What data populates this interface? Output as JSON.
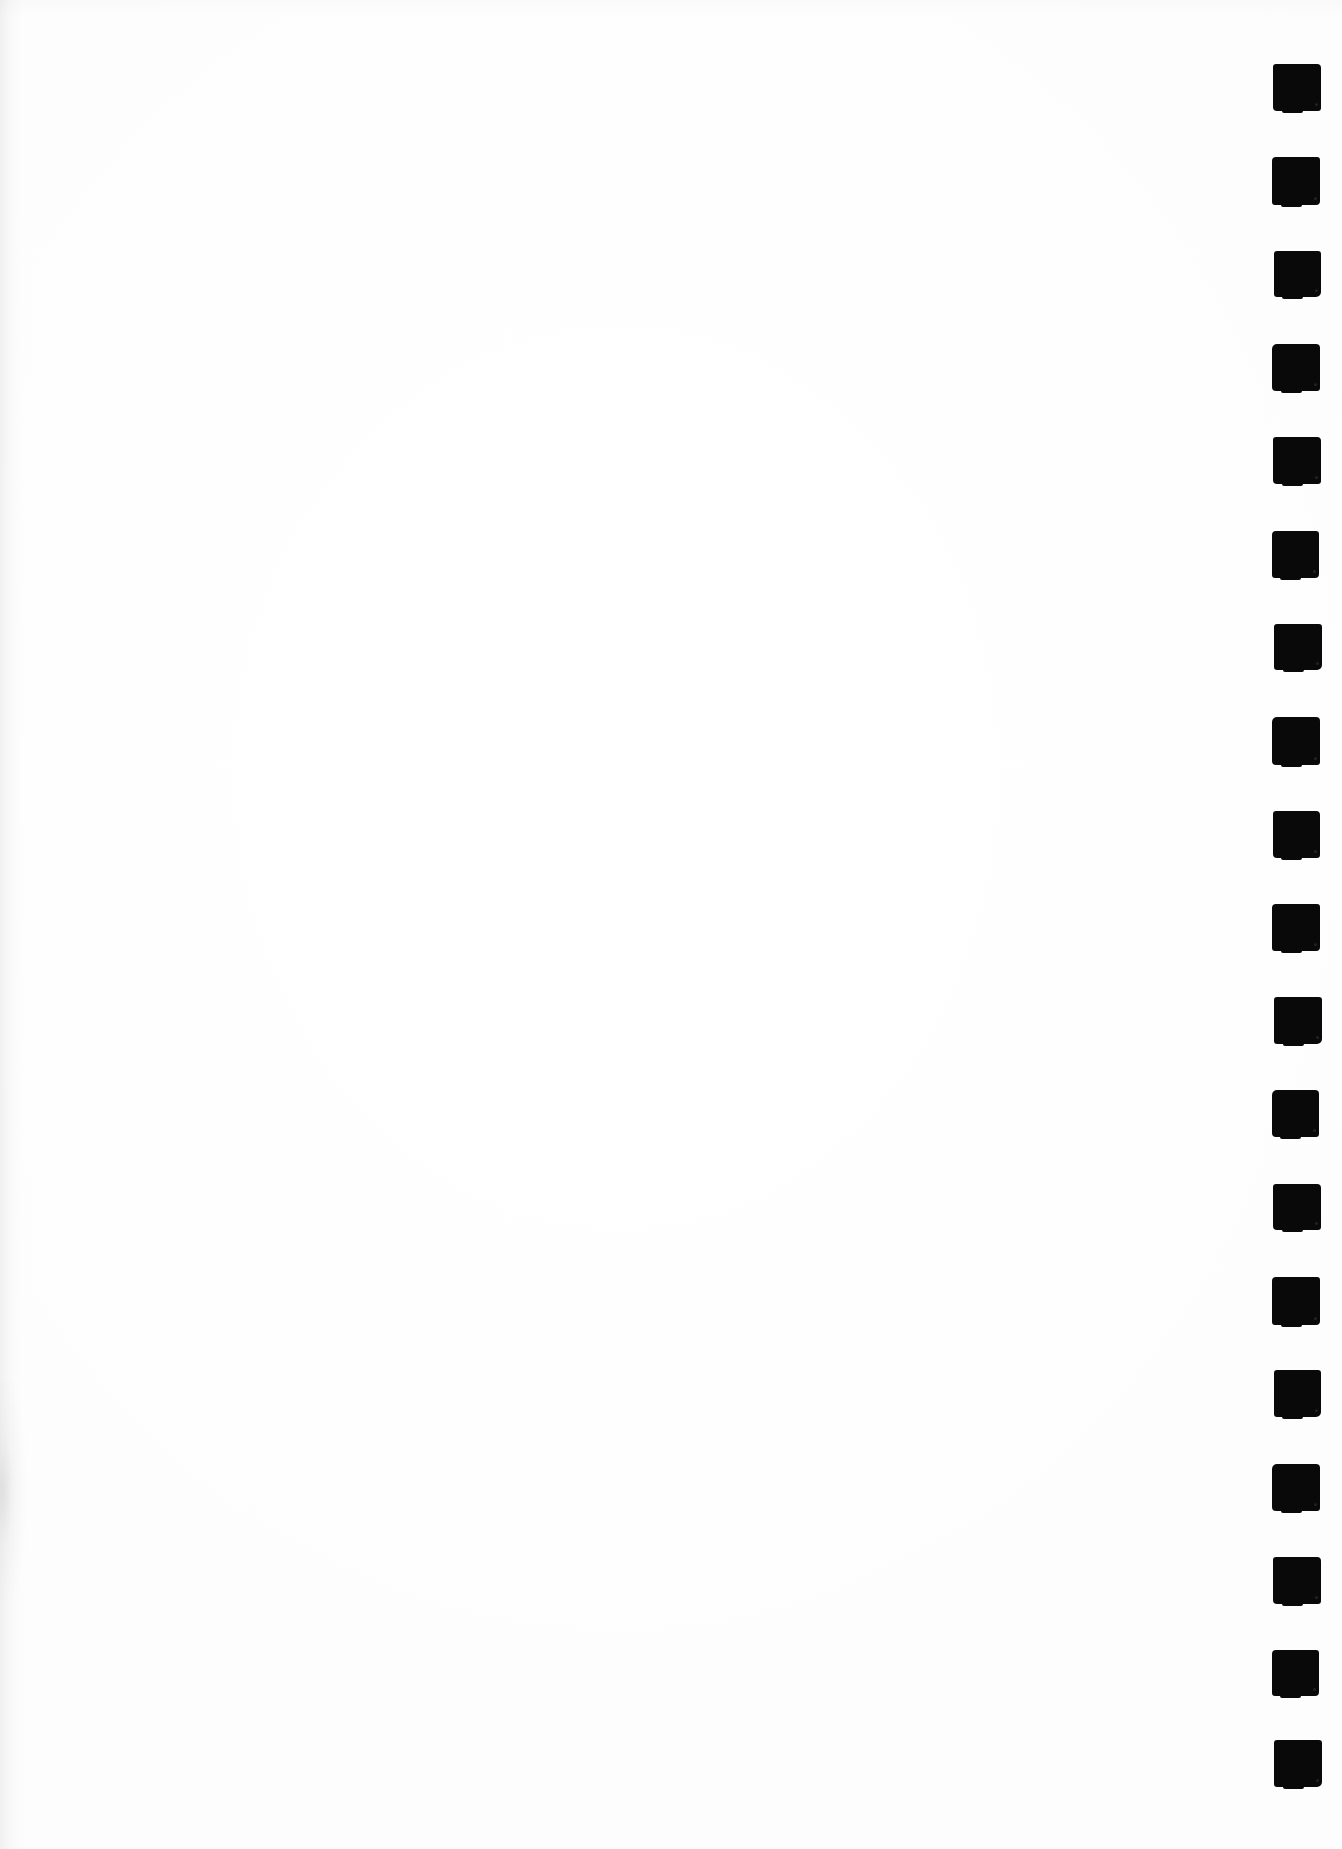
{
  "page": {
    "kind": "scanned-blank-page",
    "width": 1342,
    "height": 1849,
    "background_color": "#fefefe",
    "content_text": ""
  },
  "ink": {
    "color": "#090909",
    "mark_shape": "square"
  },
  "register_marks": {
    "name": "right-margin-index-marks",
    "count": 19,
    "shape": "square",
    "color": "#090909",
    "width": 48,
    "height": 47,
    "column_left": 1272,
    "first_top": 64,
    "vertical_spacing": 93.3,
    "items": [
      {
        "index": 1,
        "x": 1273,
        "y": 64,
        "w": 48,
        "h": 47
      },
      {
        "index": 2,
        "x": 1272,
        "y": 157,
        "w": 48,
        "h": 48
      },
      {
        "index": 3,
        "x": 1274,
        "y": 251,
        "w": 47,
        "h": 46
      },
      {
        "index": 4,
        "x": 1272,
        "y": 344,
        "w": 48,
        "h": 47
      },
      {
        "index": 5,
        "x": 1273,
        "y": 437,
        "w": 48,
        "h": 47
      },
      {
        "index": 6,
        "x": 1272,
        "y": 531,
        "w": 47,
        "h": 47
      },
      {
        "index": 7,
        "x": 1274,
        "y": 624,
        "w": 48,
        "h": 46
      },
      {
        "index": 8,
        "x": 1272,
        "y": 717,
        "w": 48,
        "h": 48
      },
      {
        "index": 9,
        "x": 1273,
        "y": 811,
        "w": 47,
        "h": 47
      },
      {
        "index": 10,
        "x": 1272,
        "y": 904,
        "w": 48,
        "h": 47
      },
      {
        "index": 11,
        "x": 1274,
        "y": 997,
        "w": 48,
        "h": 47
      },
      {
        "index": 12,
        "x": 1272,
        "y": 1090,
        "w": 47,
        "h": 47
      },
      {
        "index": 13,
        "x": 1273,
        "y": 1184,
        "w": 48,
        "h": 46
      },
      {
        "index": 14,
        "x": 1272,
        "y": 1277,
        "w": 48,
        "h": 48
      },
      {
        "index": 15,
        "x": 1274,
        "y": 1370,
        "w": 47,
        "h": 47
      },
      {
        "index": 16,
        "x": 1272,
        "y": 1464,
        "w": 48,
        "h": 47
      },
      {
        "index": 17,
        "x": 1273,
        "y": 1557,
        "w": 48,
        "h": 47
      },
      {
        "index": 18,
        "x": 1272,
        "y": 1650,
        "w": 47,
        "h": 46
      },
      {
        "index": 19,
        "x": 1274,
        "y": 1740,
        "w": 48,
        "h": 47
      }
    ]
  },
  "scan_artifacts": {
    "left_edge_shadow": true,
    "lower_left_smudge": true,
    "top_edge_tone": true
  }
}
